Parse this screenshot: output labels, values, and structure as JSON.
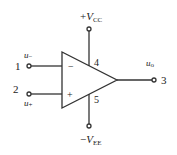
{
  "diagram": {
    "type": "op-amp symbol",
    "supply_pos": {
      "sign": "+",
      "var": "V",
      "sub": "CC"
    },
    "supply_neg": {
      "sign": "−",
      "var": "V",
      "sub": "EE"
    },
    "inputs": [
      {
        "pin": "1",
        "var": "u",
        "sub": "−",
        "polarity": "−"
      },
      {
        "pin": "2",
        "var": "u",
        "sub": "+",
        "polarity": "+"
      }
    ],
    "output": {
      "pin": "3",
      "var": "u",
      "sub": "o"
    },
    "power_pins": {
      "pos": "4",
      "neg": "5"
    },
    "colors": {
      "stroke": "#333333",
      "text": "#222222"
    }
  }
}
